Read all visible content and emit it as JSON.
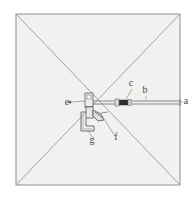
{
  "figure": {
    "type": "line-diagram",
    "background_color": "#ffffff",
    "panel_fill_color": "#f1f1ef",
    "line_color": "#8a8a8a",
    "dark_part_color": "#2e2e2e",
    "label_color": "#4a4a4a",
    "canvas": {
      "width": 196,
      "height": 204
    },
    "square": {
      "x": 16,
      "y": 14,
      "width": 164,
      "height": 171
    },
    "hub": {
      "x": 89,
      "y": 102
    },
    "rod": {
      "from_x": 89,
      "to_x": 180,
      "y": 102
    },
    "labels": [
      {
        "key": "a",
        "text": "a",
        "x": 186,
        "y": 104,
        "points_to": "rod-outer-end"
      },
      {
        "key": "b",
        "text": "b",
        "x": 145,
        "y": 93,
        "points_to": "rod-shaft"
      },
      {
        "key": "c",
        "text": "c",
        "x": 131,
        "y": 86,
        "points_to": "rod-collar"
      },
      {
        "key": "e",
        "text": "e",
        "x": 67,
        "y": 105,
        "points_to": "hub-block"
      },
      {
        "key": "f",
        "text": "f",
        "x": 116,
        "y": 140,
        "points_to": "lower-linkage"
      },
      {
        "key": "g",
        "text": "g",
        "x": 92,
        "y": 143,
        "points_to": "lower-bracket"
      }
    ]
  }
}
